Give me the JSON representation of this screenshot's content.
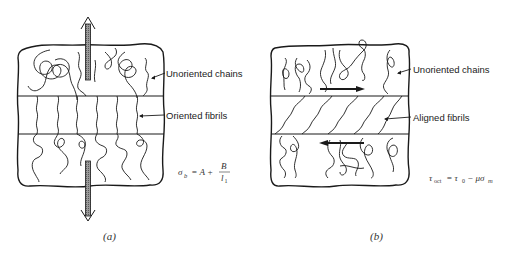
{
  "figure": {
    "panels": [
      {
        "id": "a",
        "caption": "(a)",
        "labels": {
          "top_region": "Unoriented chains",
          "middle_band": "Oriented fibrils"
        },
        "equation": {
          "lhs": "σ",
          "lhs_sub": "b",
          "eq": " = A + ",
          "frac_num": "B",
          "frac_den": "l",
          "frac_den_sub": "1"
        },
        "loading": "tensile (vertical arrows, up and down)"
      },
      {
        "id": "b",
        "caption": "(b)",
        "labels": {
          "top_region": "Unoriented chains",
          "middle_band": "Aligned fibrils"
        },
        "equation": {
          "lhs": "τ",
          "lhs_sub": "oct",
          "eq": " = τ",
          "eq_sub": "0",
          "rest": " − μσ",
          "rest_sub": "m"
        },
        "loading": "shear (horizontal arrows, opposite directions)"
      }
    ],
    "colors": {
      "ink": "#1a1a1a",
      "arrow_fill": "#8a8a8a",
      "background": "#ffffff"
    }
  }
}
